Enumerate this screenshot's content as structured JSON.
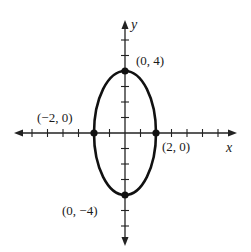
{
  "chart_data": {
    "type": "line",
    "title": "",
    "xlabel": "x",
    "ylabel": "y",
    "xlim": [
      -7,
      7
    ],
    "ylim": [
      -7,
      7
    ],
    "grid": false,
    "ticks_every": 1,
    "curve": {
      "shape": "ellipse",
      "center": [
        0,
        0
      ],
      "semi_axis_x": 2,
      "semi_axis_y": 4
    },
    "points": [
      {
        "x": 0,
        "y": 4,
        "label": "(0, 4)"
      },
      {
        "x": -2,
        "y": 0,
        "label": "(−2, 0)"
      },
      {
        "x": 2,
        "y": 0,
        "label": "(2, 0)"
      },
      {
        "x": 0,
        "y": -4,
        "label": "(0, −4)"
      }
    ],
    "colors": {
      "curve": "#111111",
      "axes": "#222222",
      "points": "#111111"
    }
  },
  "labels": {
    "x_axis": "x",
    "y_axis": "y",
    "top": "(0, 4)",
    "left": "(−2, 0)",
    "right": "(2, 0)",
    "bottom": "(0, −4)"
  }
}
